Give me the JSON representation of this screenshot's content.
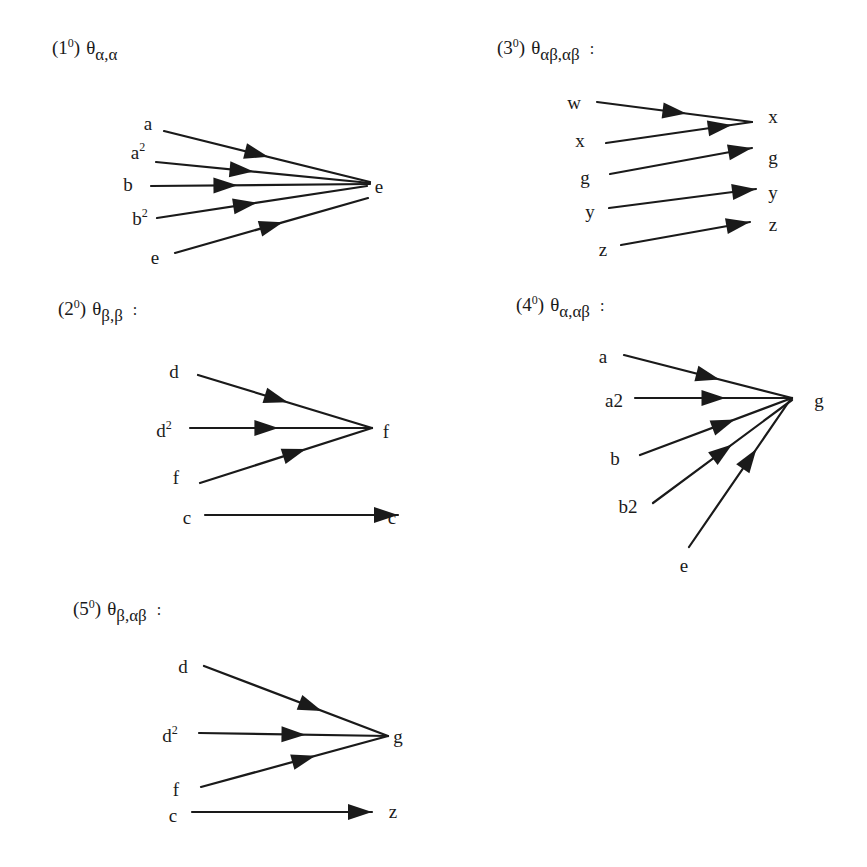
{
  "diagrams": [
    {
      "id": "1",
      "title": {
        "num": "1",
        "sup": "0",
        "theta": "θ",
        "sub": "α,α",
        "colon": ""
      },
      "title_pos": [
        52,
        36
      ],
      "target": {
        "label": "e",
        "x": 370,
        "y": 184
      },
      "arrows": [
        {
          "from": "a",
          "sup": "",
          "lx": 148,
          "ly": 124,
          "x1": 164,
          "y1": 131,
          "x2": 370,
          "y2": 182,
          "t": 0.45
        },
        {
          "from": "a",
          "sup": "2",
          "lx": 138,
          "ly": 152,
          "x1": 156,
          "y1": 162,
          "x2": 370,
          "y2": 183,
          "t": 0.4
        },
        {
          "from": "b",
          "sup": "",
          "lx": 128,
          "ly": 185,
          "x1": 151,
          "y1": 186,
          "x2": 370,
          "y2": 184,
          "t": 0.34
        },
        {
          "from": "b",
          "sup": "2",
          "lx": 140,
          "ly": 218,
          "x1": 157,
          "y1": 218,
          "x2": 367,
          "y2": 186,
          "t": 0.42
        },
        {
          "from": "e",
          "sup": "",
          "lx": 155,
          "ly": 258,
          "x1": 175,
          "y1": 253,
          "x2": 368,
          "y2": 198,
          "t": 0.5
        }
      ],
      "target_label_pos": [
        379,
        187
      ]
    },
    {
      "id": "2",
      "title": {
        "num": "2",
        "sup": "0",
        "theta": "θ",
        "sub": "β,β",
        "colon": ":"
      },
      "title_pos": [
        58,
        297
      ],
      "arrows": [
        {
          "from": "d",
          "sup": "",
          "lx": 174,
          "ly": 372,
          "x1": 198,
          "y1": 375,
          "x2": 372,
          "y2": 428,
          "t": 0.45
        },
        {
          "from": "d",
          "sup": "2",
          "lx": 164,
          "ly": 430,
          "x1": 190,
          "y1": 428,
          "x2": 372,
          "y2": 428,
          "t": 0.42
        },
        {
          "from": "f",
          "sup": "",
          "lx": 176,
          "ly": 478,
          "x1": 200,
          "y1": 483,
          "x2": 372,
          "y2": 428,
          "t": 0.55
        },
        {
          "from": "c",
          "sup": "",
          "lx": 187,
          "ly": 518,
          "x1": 205,
          "y1": 515,
          "x2": 398,
          "y2": 515,
          "t": 1.0
        }
      ],
      "targets": [
        {
          "label": "f",
          "x": 386,
          "y": 432
        },
        {
          "label": "c",
          "x": 392,
          "y": 518
        }
      ]
    },
    {
      "id": "3",
      "title": {
        "num": "3",
        "sup": "0",
        "theta": "θ",
        "sub": "αβ,αβ",
        "colon": ":"
      },
      "title_pos": [
        497,
        36
      ],
      "arrows": [
        {
          "from": "w",
          "sup": "",
          "lx": 574,
          "ly": 103,
          "x1": 597,
          "y1": 102,
          "x2": 752,
          "y2": 122,
          "t": 0.5
        },
        {
          "from": "x",
          "sup": "",
          "lx": 580,
          "ly": 141,
          "x1": 606,
          "y1": 143,
          "x2": 752,
          "y2": 122,
          "t": 0.78
        },
        {
          "from": "g",
          "sup": "",
          "lx": 585,
          "ly": 178,
          "x1": 610,
          "y1": 174,
          "x2": 752,
          "y2": 148,
          "t": 1.0
        },
        {
          "from": "y",
          "sup": "",
          "lx": 590,
          "ly": 212,
          "x1": 609,
          "y1": 208,
          "x2": 756,
          "y2": 189,
          "t": 1.0
        },
        {
          "from": "z",
          "sup": "",
          "lx": 603,
          "ly": 250,
          "x1": 621,
          "y1": 245,
          "x2": 750,
          "y2": 222,
          "t": 1.0
        }
      ],
      "targets": [
        {
          "label": "x",
          "x": 773,
          "y": 117
        },
        {
          "label": "g",
          "x": 773,
          "y": 158
        },
        {
          "label": "y",
          "x": 773,
          "y": 193
        },
        {
          "label": "z",
          "x": 773,
          "y": 225
        }
      ]
    },
    {
      "id": "4",
      "title": {
        "num": "4",
        "sup": "0",
        "theta": "θ",
        "sub": "α,αβ",
        "colon": ":"
      },
      "title_pos": [
        516,
        293
      ],
      "arrows": [
        {
          "from": "a",
          "sup": "",
          "lx": 603,
          "ly": 357,
          "x1": 624,
          "y1": 355,
          "x2": 792,
          "y2": 398,
          "t": 0.5
        },
        {
          "from": "a2",
          "sup": "",
          "lx": 614,
          "ly": 401,
          "x1": 635,
          "y1": 398,
          "x2": 792,
          "y2": 398,
          "t": 0.5
        },
        {
          "from": "b",
          "sup": "",
          "lx": 615,
          "ly": 459,
          "x1": 640,
          "y1": 455,
          "x2": 792,
          "y2": 398,
          "t": 0.55
        },
        {
          "from": "b2",
          "sup": "",
          "lx": 628,
          "ly": 507,
          "x1": 653,
          "y1": 503,
          "x2": 792,
          "y2": 400,
          "t": 0.5
        },
        {
          "from": "e",
          "sup": "",
          "lx": 684,
          "ly": 566,
          "x1": 689,
          "y1": 547,
          "x2": 790,
          "y2": 400,
          "t": 0.6
        }
      ],
      "targets": [
        {
          "label": "g",
          "x": 819,
          "y": 401
        }
      ]
    },
    {
      "id": "5",
      "title": {
        "num": "5",
        "sup": "0",
        "theta": "θ",
        "sub": "β,αβ",
        "colon": ":"
      },
      "title_pos": [
        73,
        597
      ],
      "arrows": [
        {
          "from": "d",
          "sup": "",
          "lx": 183,
          "ly": 667,
          "x1": 204,
          "y1": 666,
          "x2": 388,
          "y2": 736,
          "t": 0.58
        },
        {
          "from": "d",
          "sup": "2",
          "lx": 170,
          "ly": 735,
          "x1": 199,
          "y1": 733,
          "x2": 388,
          "y2": 736,
          "t": 0.5
        },
        {
          "from": "f",
          "sup": "",
          "lx": 176,
          "ly": 790,
          "x1": 201,
          "y1": 787,
          "x2": 388,
          "y2": 736,
          "t": 0.55
        },
        {
          "from": "c",
          "sup": "",
          "lx": 173,
          "ly": 816,
          "x1": 192,
          "y1": 812,
          "x2": 372,
          "y2": 812,
          "t": 1.0
        }
      ],
      "targets": [
        {
          "label": "g",
          "x": 398,
          "y": 737
        },
        {
          "label": "z",
          "x": 393,
          "y": 812
        }
      ]
    }
  ],
  "style": {
    "ink": "#1a1a1a",
    "paper": "#ffffff"
  }
}
